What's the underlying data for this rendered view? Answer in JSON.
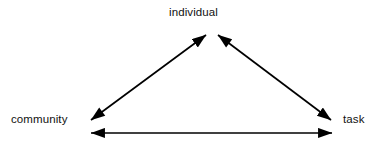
{
  "diagram": {
    "background_color": "#ffffff",
    "stroke_color": "#000000",
    "nodes": [
      {
        "id": "individual",
        "label": "individual",
        "position": "top-center"
      },
      {
        "id": "community",
        "label": "community",
        "position": "bottom-left"
      },
      {
        "id": "task",
        "label": "task",
        "position": "bottom-right"
      }
    ],
    "edges": [
      {
        "id": "community-individual",
        "from": "community",
        "to": "individual",
        "style": "double-arrow"
      },
      {
        "id": "individual-task",
        "from": "individual",
        "to": "task",
        "style": "double-arrow"
      },
      {
        "id": "community-task",
        "from": "community",
        "to": "task",
        "style": "double-arrow"
      }
    ]
  }
}
